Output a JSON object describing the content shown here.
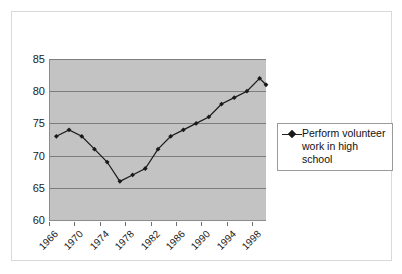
{
  "chart_data": {
    "type": "line",
    "title": "",
    "xlabel": "",
    "ylabel": "",
    "ylim": [
      60,
      85
    ],
    "ytick_values": [
      60,
      65,
      70,
      75,
      80,
      85
    ],
    "ytick_labels": [
      "60",
      "65",
      "70",
      "75",
      "80",
      "85"
    ],
    "xlim": [
      1966,
      2000
    ],
    "xtick_values": [
      1966,
      1970,
      1974,
      1978,
      1982,
      1986,
      1990,
      1994,
      1998
    ],
    "xtick_labels": [
      "1966",
      "1970",
      "1974",
      "1978",
      "1982",
      "1986",
      "1990",
      "1994",
      "1998"
    ],
    "grid": "horizontal",
    "legend_position": "right",
    "series": [
      {
        "name": "Perform volunteer work in high school",
        "marker": "diamond",
        "color": "#1a1a1a",
        "x": [
          1967,
          1969,
          1971,
          1973,
          1975,
          1977,
          1979,
          1981,
          1983,
          1985,
          1987,
          1989,
          1991,
          1993,
          1995,
          1997,
          1999,
          2000
        ],
        "values": [
          73,
          74,
          73,
          71,
          69,
          66,
          67,
          68,
          71,
          73,
          74,
          75,
          76,
          78,
          79,
          80,
          82,
          81
        ]
      }
    ]
  },
  "legend": {
    "entries": [
      {
        "label": "Perform volunteer work in high school",
        "marker_icon": "diamond-marker-icon"
      }
    ]
  },
  "colors": {
    "plot_background": "#c3c3c3",
    "gridline": "#7d7d7d",
    "series_line": "#1a1a1a",
    "frame_border": "#d9d9d9",
    "legend_border": "#9a9a9a"
  }
}
